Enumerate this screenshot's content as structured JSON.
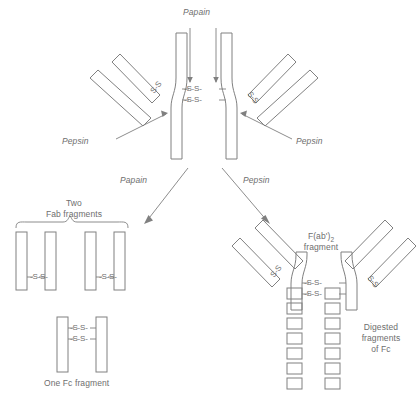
{
  "diagram": {
    "stroke_color": "#808080",
    "text_color": "#6e6e6e",
    "background_color": "#ffffff"
  },
  "top_enzyme": {
    "papain": "Papain"
  },
  "hinge_bonds": {
    "bond1": "-S-S-",
    "bond2": "-S-S-"
  },
  "arm_bonds": {
    "left": "S-S",
    "right": "S-S"
  },
  "side_enzymes": {
    "left_pepsin": "Pepsin",
    "right_pepsin": "Pepsin"
  },
  "pathways": {
    "left_label": "Papain",
    "right_label": "Pepsin"
  },
  "fab": {
    "title_line1": "Two",
    "title_line2": "Fab fragments",
    "pair1_bond": "-S-S-",
    "pair2_bond": "-S-S-"
  },
  "fc": {
    "caption": "One Fc fragment",
    "bond1": "-S-S-",
    "bond2": "-S-S-"
  },
  "fab2": {
    "title_line1": "F(ab')",
    "title_sub": "2",
    "title_line2": "fragment",
    "hinge_bond1": "-S-S-",
    "hinge_bond2": "-S-S-",
    "arm_bond_left": "S-S",
    "arm_bond_right": "S-S"
  },
  "digested": {
    "line1": "Digested",
    "line2": "fragments",
    "line3": "of Fc",
    "fragment_count_per_column": 7,
    "columns": 2
  }
}
